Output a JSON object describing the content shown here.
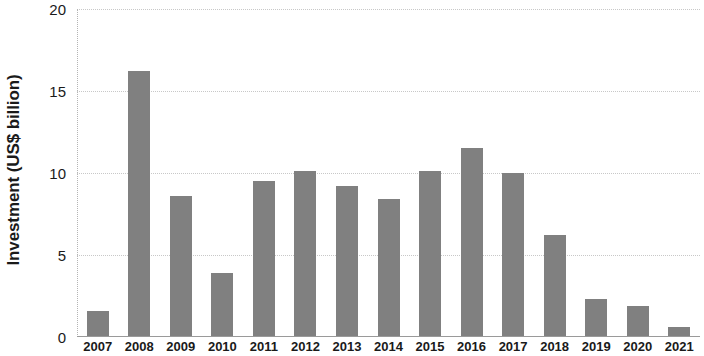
{
  "chart_data": {
    "type": "bar",
    "title": "",
    "subtitle": "",
    "xlabel": "",
    "ylabel": "Investment (US$ billion)",
    "categories": [
      "2007",
      "2008",
      "2009",
      "2010",
      "2011",
      "2012",
      "2013",
      "2014",
      "2015",
      "2016",
      "2017",
      "2018",
      "2019",
      "2020",
      "2021"
    ],
    "values": [
      1.6,
      16.2,
      8.6,
      3.9,
      9.5,
      10.1,
      9.2,
      8.4,
      10.1,
      11.5,
      10.0,
      6.2,
      2.3,
      1.9,
      0.6
    ],
    "ylim": [
      0,
      20
    ],
    "y_ticks": [
      0,
      5,
      10,
      15,
      20
    ],
    "y_tick_labels": [
      "0",
      "5",
      "10",
      "15",
      "20"
    ],
    "grid": true,
    "grid_axis": "y",
    "legend": false,
    "legend_position": "none",
    "bar_color": "#808080",
    "series": [
      {
        "name": "Investment",
        "values": [
          1.6,
          16.2,
          8.6,
          3.9,
          9.5,
          10.1,
          9.2,
          8.4,
          10.1,
          11.5,
          10.0,
          6.2,
          2.3,
          1.9,
          0.6
        ]
      }
    ]
  },
  "axes": {
    "y_title": "Investment (US$ billion)",
    "y_tick_0": "0",
    "y_tick_1": "5",
    "y_tick_2": "10",
    "y_tick_3": "15",
    "y_tick_4": "20"
  },
  "colors": {
    "bar": "#808080",
    "gridline": "#c8c8c8",
    "axis": "#9a9a9a",
    "text": "#1a1a1a",
    "background": "#ffffff"
  }
}
